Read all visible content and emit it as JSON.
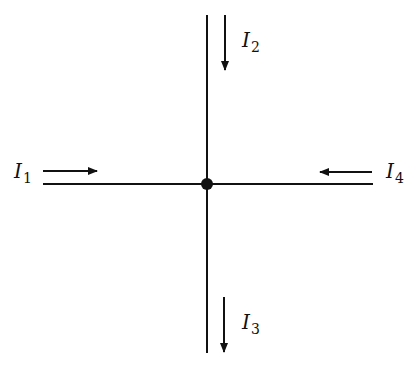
{
  "diagram": {
    "node": {
      "x": 207,
      "y": 184,
      "r": 6
    },
    "wires": [
      {
        "name": "vertical-wire",
        "x1": 207,
        "y1": 15,
        "x2": 207,
        "y2": 353
      },
      {
        "name": "horizontal-wire",
        "x1": 43,
        "y1": 184,
        "x2": 373,
        "y2": 184
      }
    ],
    "currents": [
      {
        "id": "I1",
        "symbol": "I",
        "subscript": "1",
        "direction": "right",
        "label_x": 14,
        "label_y": 178
      },
      {
        "id": "I2",
        "symbol": "I",
        "subscript": "2",
        "direction": "down",
        "label_x": 242,
        "label_y": 47
      },
      {
        "id": "I3",
        "symbol": "I",
        "subscript": "3",
        "direction": "down",
        "label_x": 242,
        "label_y": 329
      },
      {
        "id": "I4",
        "symbol": "I",
        "subscript": "4",
        "direction": "left",
        "label_x": 386,
        "label_y": 178
      }
    ]
  }
}
